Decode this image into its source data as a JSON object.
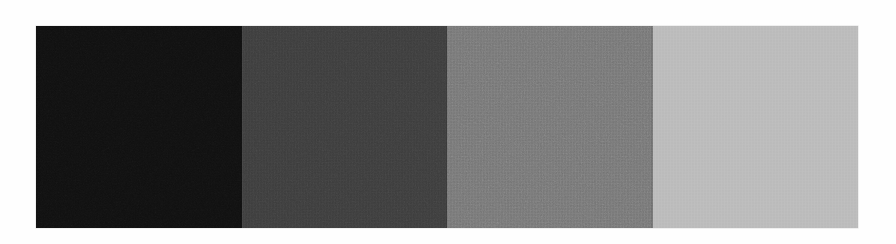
{
  "page": {
    "background_color": "#fefefe",
    "width": 896,
    "height": 244
  },
  "figure": {
    "name": "grayscale-step-wedge",
    "x": 36,
    "y": 26,
    "width": 822,
    "height": 202,
    "patch_count": 4,
    "texture": "film-grain-noise"
  },
  "chart_data": {
    "type": "heatmap",
    "title": "",
    "subtitle": "",
    "xlabel": "",
    "ylabel": "",
    "grid": false,
    "legend": "none",
    "orientation": "horizontal",
    "categories": [
      "1",
      "2",
      "3",
      "4"
    ],
    "values": [
      14,
      59,
      118,
      184
    ],
    "value_units": "8-bit gray level",
    "ylim": [
      0,
      255
    ],
    "series": [
      {
        "name": "mean gray level",
        "values": [
          14,
          59,
          118,
          184
        ]
      },
      {
        "name": "noise amplitude",
        "values": [
          22,
          14,
          10,
          8
        ]
      }
    ],
    "colors": [
      "#0e0e0e",
      "#3b3b3b",
      "#767676",
      "#b8b8b8"
    ]
  },
  "patches": [
    {
      "name": "patch-1",
      "label": "1",
      "color": "#0e0e0e",
      "gray_level": 14,
      "noise": 22,
      "grain_opacity": 0.55,
      "grain_scale": "0.75",
      "weave_opacity": 0.12
    },
    {
      "name": "patch-2",
      "label": "2",
      "color": "#3b3b3b",
      "gray_level": 59,
      "noise": 14,
      "grain_opacity": 0.32,
      "grain_scale": "0.9",
      "weave_opacity": 0.3
    },
    {
      "name": "patch-3",
      "label": "3",
      "color": "#767676",
      "gray_level": 118,
      "noise": 10,
      "grain_opacity": 0.26,
      "grain_scale": "0.95",
      "weave_opacity": 0.34
    },
    {
      "name": "patch-4",
      "label": "4",
      "color": "#b8b8b8",
      "gray_level": 184,
      "noise": 8,
      "grain_opacity": 0.22,
      "grain_scale": "1.0",
      "weave_opacity": 0.3
    }
  ]
}
